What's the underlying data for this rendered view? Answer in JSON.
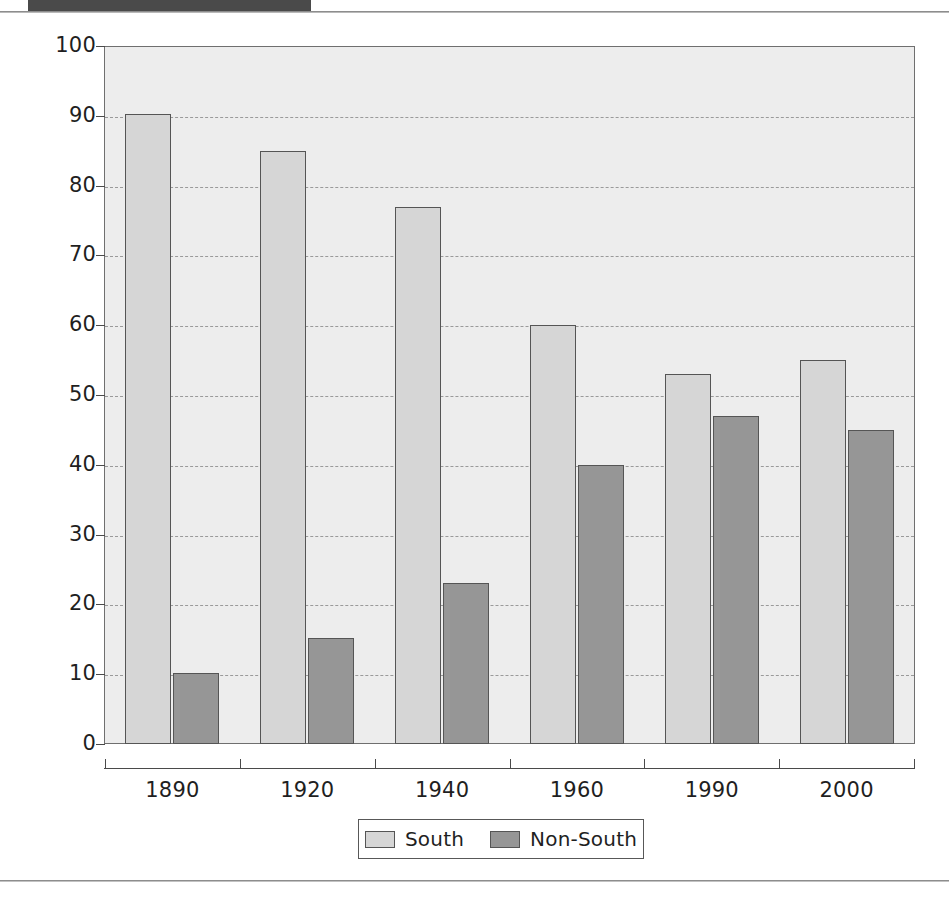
{
  "figure": {
    "header_strip": "cropped-dark-header-band",
    "axis_title_y": "Percent"
  },
  "chart_data": {
    "type": "bar",
    "title": "",
    "subtitle": "",
    "xlabel": "",
    "ylabel": "Percent",
    "ylim": [
      0,
      100
    ],
    "ytick_step": 10,
    "yticks": [
      0,
      10,
      20,
      30,
      40,
      50,
      60,
      70,
      80,
      90,
      100
    ],
    "ytick_labels": [
      "0",
      "10",
      "20",
      "30",
      "40",
      "50",
      "60",
      "70",
      "80",
      "90",
      "100"
    ],
    "categories": [
      "1890",
      "1920",
      "1940",
      "1960",
      "1990",
      "2000"
    ],
    "grid": true,
    "grid_style": "dashed-horizontal",
    "legend_position": "bottom-center",
    "series": [
      {
        "name": "South",
        "color": "#d6d6d6",
        "values": [
          90.3,
          85,
          77,
          60,
          53,
          55
        ]
      },
      {
        "name": "Non-South",
        "color": "#969696",
        "values": [
          10.2,
          15.2,
          23,
          40,
          47,
          45
        ]
      }
    ]
  },
  "legend": {
    "items": [
      {
        "label": "South",
        "swatch": "light-gray"
      },
      {
        "label": "Non-South",
        "swatch": "medium-gray"
      }
    ]
  },
  "colors": {
    "south": "#d6d6d6",
    "non_south": "#969696",
    "plot_background": "#ededed",
    "grid": "#9a9a9a",
    "axis": "#4a4a4a",
    "page_background": "#ffffff"
  }
}
